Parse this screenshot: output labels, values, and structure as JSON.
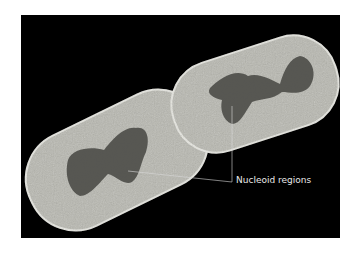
{
  "figure": {
    "annotation": {
      "label": "Nucleoid regions"
    },
    "colors": {
      "background": "#000000",
      "cell": "#b8b8b0",
      "nucleoid": "#4e4e4a",
      "label": "#e8e8e8"
    }
  }
}
